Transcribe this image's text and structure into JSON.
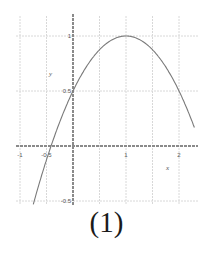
{
  "chart_data": {
    "type": "line",
    "title": "",
    "caption": "(1)",
    "xlabel": "x",
    "ylabel": "y",
    "function": "y = -0.5(x-1)^2 + 1",
    "xlim": [
      -1.0,
      2.3
    ],
    "ylim": [
      -0.5,
      1.1
    ],
    "x_ticks": [
      -1,
      -0.5,
      1,
      2
    ],
    "x_tick_labels": [
      "-1",
      "-0.5",
      "1",
      "2"
    ],
    "y_ticks": [
      1,
      0.5,
      -0.5
    ],
    "y_tick_labels": [
      "1",
      "0.5",
      "-0.5"
    ],
    "grid": true,
    "legend": null,
    "series": [
      {
        "name": "parabola",
        "x": [
          -0.75,
          -0.5,
          -0.25,
          0,
          0.25,
          0.5,
          0.75,
          1,
          1.25,
          1.5,
          1.75,
          2,
          2.25
        ],
        "values": [
          -0.53,
          -0.125,
          0.22,
          0.5,
          0.72,
          0.875,
          0.97,
          1.0,
          0.97,
          0.875,
          0.72,
          0.5,
          0.22
        ]
      }
    ],
    "key_points": {
      "vertex": [
        1,
        1
      ],
      "y_intercept": [
        0,
        0.5
      ],
      "x_intercept": [
        -0.41,
        0
      ]
    }
  },
  "colors": {
    "axis": "#8a8a8a",
    "grid": "#d8d8d8",
    "curve": "#7a7a7a",
    "text": "#555555"
  }
}
